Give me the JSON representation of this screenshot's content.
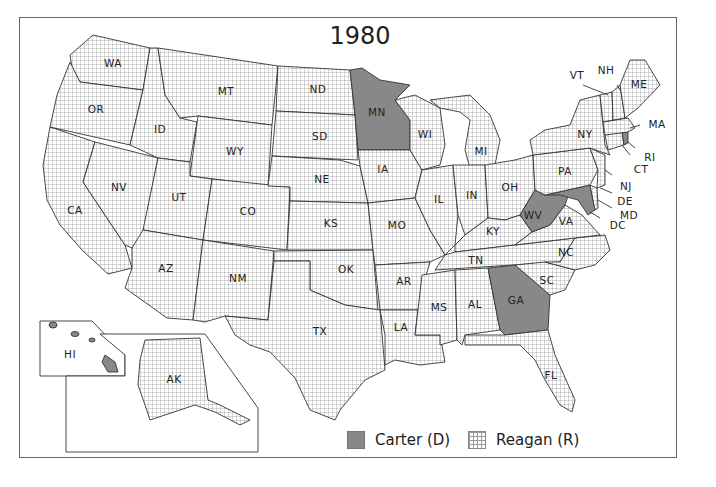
{
  "map": {
    "title": "1980",
    "colors": {
      "carter": "#888888",
      "reagan_grid": "#999999",
      "border": "#333333"
    },
    "legend": [
      {
        "label": "Carter (D)",
        "pattern": "solid-gray"
      },
      {
        "label": "Reagan (R)",
        "pattern": "grid"
      }
    ],
    "states": {
      "WA": {
        "label": "WA",
        "winner": "Reagan"
      },
      "OR": {
        "label": "OR",
        "winner": "Reagan"
      },
      "CA": {
        "label": "CA",
        "winner": "Reagan"
      },
      "NV": {
        "label": "NV",
        "winner": "Reagan"
      },
      "ID": {
        "label": "ID",
        "winner": "Reagan"
      },
      "MT": {
        "label": "MT",
        "winner": "Reagan"
      },
      "WY": {
        "label": "WY",
        "winner": "Reagan"
      },
      "UT": {
        "label": "UT",
        "winner": "Reagan"
      },
      "CO": {
        "label": "CO",
        "winner": "Reagan"
      },
      "AZ": {
        "label": "AZ",
        "winner": "Reagan"
      },
      "NM": {
        "label": "NM",
        "winner": "Reagan"
      },
      "ND": {
        "label": "ND",
        "winner": "Reagan"
      },
      "SD": {
        "label": "SD",
        "winner": "Reagan"
      },
      "NE": {
        "label": "NE",
        "winner": "Reagan"
      },
      "KS": {
        "label": "KS",
        "winner": "Reagan"
      },
      "OK": {
        "label": "OK",
        "winner": "Reagan"
      },
      "TX": {
        "label": "TX",
        "winner": "Reagan"
      },
      "MN": {
        "label": "MN",
        "winner": "Carter"
      },
      "IA": {
        "label": "IA",
        "winner": "Reagan"
      },
      "MO": {
        "label": "MO",
        "winner": "Reagan"
      },
      "AR": {
        "label": "AR",
        "winner": "Reagan"
      },
      "LA": {
        "label": "LA",
        "winner": "Reagan"
      },
      "WI": {
        "label": "WI",
        "winner": "Reagan"
      },
      "IL": {
        "label": "IL",
        "winner": "Reagan"
      },
      "MI": {
        "label": "MI",
        "winner": "Reagan"
      },
      "IN": {
        "label": "IN",
        "winner": "Reagan"
      },
      "OH": {
        "label": "OH",
        "winner": "Reagan"
      },
      "KY": {
        "label": "KY",
        "winner": "Reagan"
      },
      "TN": {
        "label": "TN",
        "winner": "Reagan"
      },
      "MS": {
        "label": "MS",
        "winner": "Reagan"
      },
      "AL": {
        "label": "AL",
        "winner": "Reagan"
      },
      "GA": {
        "label": "GA",
        "winner": "Carter"
      },
      "FL": {
        "label": "FL",
        "winner": "Reagan"
      },
      "SC": {
        "label": "SC",
        "winner": "Reagan"
      },
      "NC": {
        "label": "NC",
        "winner": "Reagan"
      },
      "VA": {
        "label": "VA",
        "winner": "Reagan"
      },
      "WV": {
        "label": "WV",
        "winner": "Carter"
      },
      "MD": {
        "label": "MD",
        "winner": "Carter"
      },
      "DC": {
        "label": "DC",
        "winner": "Carter"
      },
      "DE": {
        "label": "DE",
        "winner": "Reagan"
      },
      "PA": {
        "label": "PA",
        "winner": "Reagan"
      },
      "NJ": {
        "label": "NJ",
        "winner": "Reagan"
      },
      "NY": {
        "label": "NY",
        "winner": "Reagan"
      },
      "CT": {
        "label": "CT",
        "winner": "Reagan"
      },
      "RI": {
        "label": "RI",
        "winner": "Carter"
      },
      "MA": {
        "label": "MA",
        "winner": "Reagan"
      },
      "VT": {
        "label": "VT",
        "winner": "Reagan"
      },
      "NH": {
        "label": "NH",
        "winner": "Reagan"
      },
      "ME": {
        "label": "ME",
        "winner": "Reagan"
      },
      "AK": {
        "label": "AK",
        "winner": "Reagan"
      },
      "HI": {
        "label": "HI",
        "winner": "Carter"
      }
    }
  }
}
